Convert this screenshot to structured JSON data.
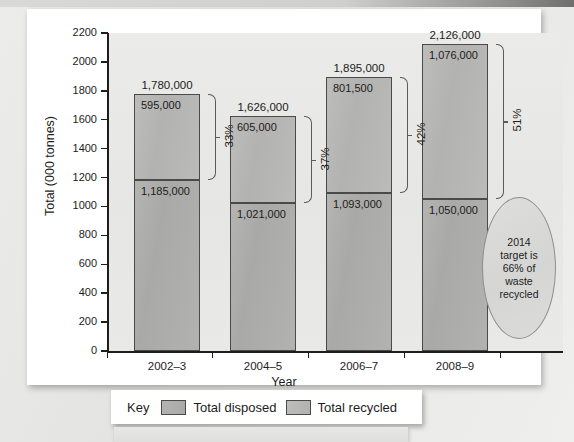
{
  "chart_data": {
    "type": "bar",
    "subtype": "stacked",
    "title": "",
    "xlabel": "Year",
    "ylabel": "Total (000 tonnes)",
    "ylim": [
      0,
      2200
    ],
    "ytick_step": 200,
    "yticks": [
      "2200",
      "2000",
      "1800",
      "1600",
      "1400",
      "1200",
      "1000",
      "800",
      "600",
      "400",
      "200",
      "0"
    ],
    "grid": false,
    "legend_position": "bottom",
    "categories": [
      "2002–3",
      "2004–5",
      "2006–7",
      "2008–9"
    ],
    "series": [
      {
        "name": "Total disposed",
        "values": [
          1185000,
          1021000,
          1093000,
          1050000
        ],
        "labels": [
          "1,185,000",
          "1,021,000",
          "1,093,000",
          "1,050,000"
        ]
      },
      {
        "name": "Total recycled",
        "values": [
          595000,
          605000,
          801500,
          1076000
        ],
        "labels": [
          "595,000",
          "605,000",
          "801,500",
          "1,076,000"
        ]
      }
    ],
    "totals": [
      1780000,
      1626000,
      1895000,
      2126000
    ],
    "total_labels": [
      "1,780,000",
      "1,626,000",
      "1,895,000",
      "2,126,000"
    ],
    "recycled_percent_labels": [
      "33%",
      "37%",
      "42%",
      "51%"
    ],
    "annotation": "2014 target is 66% of waste recycled",
    "colors": {
      "disposed": "#aeaeac",
      "recycled": "#b8b8b6",
      "outline": "#4a4a48",
      "panel": "#e8e8e6",
      "text": "#1d1d1b"
    }
  },
  "axes": {
    "y_title": "Total (000 tonnes)",
    "x_title": "Year",
    "y_ticks": [
      "2200",
      "2000",
      "1800",
      "1600",
      "1400",
      "1200",
      "1000",
      "800",
      "600",
      "400",
      "200",
      "0"
    ],
    "x_ticks": [
      "2002–3",
      "2004–5",
      "2006–7",
      "2008–9"
    ]
  },
  "legend": {
    "title": "Key",
    "items": [
      {
        "label": "Total disposed",
        "swatch": "disposed"
      },
      {
        "label": "Total recycled",
        "swatch": "recycled"
      }
    ]
  },
  "callout": {
    "lines": [
      "2014",
      "target is",
      "66% of",
      "waste",
      "recycled"
    ],
    "text": "2014 target is 66% of waste recycled"
  }
}
